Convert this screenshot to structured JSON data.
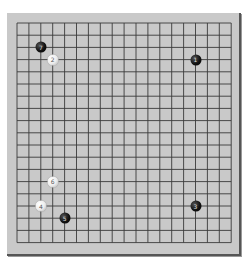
{
  "board": {
    "size": 19,
    "colors": {
      "board": "#c9c9c9",
      "line": "#3a3a3a"
    },
    "grid": {
      "x0": 10,
      "y0": 10,
      "step_x": 11.9,
      "step_y": 12.2
    }
  },
  "stones": [
    {
      "move": "1",
      "color": "black",
      "col": 15,
      "row": 3
    },
    {
      "move": "2",
      "color": "white",
      "col": 3,
      "row": 3
    },
    {
      "move": "3",
      "color": "black",
      "col": 15,
      "row": 15
    },
    {
      "move": "4",
      "color": "white",
      "col": 2,
      "row": 15
    },
    {
      "move": "5",
      "color": "black",
      "col": 4,
      "row": 16
    },
    {
      "move": "6",
      "color": "white",
      "col": 3,
      "row": 13
    },
    {
      "move": "7",
      "color": "black",
      "col": 2,
      "row": 2
    }
  ]
}
